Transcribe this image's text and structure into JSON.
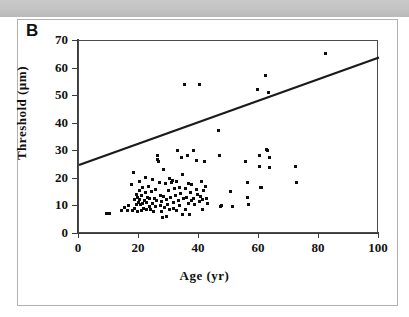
{
  "figure": {
    "panel_label": "B",
    "scan_band_text": "",
    "border_color": "#b0b0b0"
  },
  "chart_data": {
    "type": "scatter",
    "title": "",
    "xlabel": "Age (yr)",
    "ylabel": "Threshold (µm)",
    "xlim": [
      0,
      100
    ],
    "ylim": [
      0,
      70
    ],
    "xticks": [
      0,
      20,
      40,
      60,
      80,
      100
    ],
    "yticks": [
      0,
      10,
      20,
      30,
      40,
      50,
      60,
      70
    ],
    "grid": false,
    "legend": null,
    "annotation": "Thr = 0.39*Age + 25",
    "marker_color": "#0d0d0d",
    "line_color": "#1a1a1a",
    "fit": {
      "slope": 0.39,
      "intercept": 25,
      "x_start": 0,
      "x_end": 100,
      "y_start": 25,
      "y_end": 64
    },
    "points": [
      [
        9.0,
        7.6
      ],
      [
        10.2,
        7.6
      ],
      [
        14.3,
        8.4
      ],
      [
        15.3,
        9.6
      ],
      [
        16.2,
        8.4
      ],
      [
        16.5,
        10.2
      ],
      [
        17.6,
        18.0
      ],
      [
        17.9,
        8.4
      ],
      [
        18.2,
        22.2
      ],
      [
        18.4,
        12.4
      ],
      [
        18.6,
        9.2
      ],
      [
        19.0,
        14.4
      ],
      [
        19.2,
        10.6
      ],
      [
        19.4,
        8.3
      ],
      [
        19.6,
        13.2
      ],
      [
        19.8,
        11.4
      ],
      [
        20.0,
        19.2
      ],
      [
        20.1,
        15.6
      ],
      [
        20.3,
        12.6
      ],
      [
        20.5,
        10.8
      ],
      [
        20.7,
        8.6
      ],
      [
        20.9,
        13.8
      ],
      [
        21.1,
        11.2
      ],
      [
        21.3,
        16.8
      ],
      [
        21.5,
        9.4
      ],
      [
        21.8,
        12.0
      ],
      [
        22.0,
        20.4
      ],
      [
        22.2,
        15.0
      ],
      [
        22.4,
        11.6
      ],
      [
        22.6,
        8.8
      ],
      [
        22.9,
        13.4
      ],
      [
        23.1,
        17.4
      ],
      [
        23.4,
        10.0
      ],
      [
        23.6,
        12.8
      ],
      [
        23.9,
        9.0
      ],
      [
        24.1,
        15.4
      ],
      [
        24.4,
        19.8
      ],
      [
        24.6,
        11.0
      ],
      [
        24.9,
        8.2
      ],
      [
        25.1,
        13.0
      ],
      [
        25.4,
        16.2
      ],
      [
        25.6,
        9.8
      ],
      [
        25.9,
        12.2
      ],
      [
        26.1,
        28.6
      ],
      [
        26.3,
        27.0
      ],
      [
        26.6,
        26.4
      ],
      [
        26.8,
        18.6
      ],
      [
        27.0,
        10.4
      ],
      [
        27.2,
        14.0
      ],
      [
        27.4,
        8.0
      ],
      [
        27.6,
        11.8
      ],
      [
        27.9,
        6.0
      ],
      [
        28.1,
        23.4
      ],
      [
        28.3,
        13.6
      ],
      [
        28.5,
        9.6
      ],
      [
        28.7,
        18.2
      ],
      [
        29.0,
        12.4
      ],
      [
        29.2,
        6.2
      ],
      [
        29.5,
        10.6
      ],
      [
        29.8,
        15.8
      ],
      [
        30.0,
        20.0
      ],
      [
        30.3,
        8.8
      ],
      [
        30.6,
        13.2
      ],
      [
        30.9,
        18.8
      ],
      [
        31.1,
        19.4
      ],
      [
        31.4,
        11.4
      ],
      [
        31.6,
        9.2
      ],
      [
        31.9,
        16.4
      ],
      [
        32.1,
        13.8
      ],
      [
        32.4,
        19.0
      ],
      [
        32.6,
        8.6
      ],
      [
        32.9,
        30.4
      ],
      [
        33.1,
        12.0
      ],
      [
        33.4,
        17.0
      ],
      [
        33.6,
        10.2
      ],
      [
        33.9,
        14.6
      ],
      [
        34.1,
        27.6
      ],
      [
        34.4,
        21.6
      ],
      [
        34.6,
        7.2
      ],
      [
        34.9,
        12.8
      ],
      [
        35.1,
        54.2
      ],
      [
        35.4,
        16.6
      ],
      [
        35.6,
        9.0
      ],
      [
        35.9,
        13.4
      ],
      [
        36.1,
        28.4
      ],
      [
        36.4,
        11.0
      ],
      [
        36.6,
        18.4
      ],
      [
        36.9,
        7.0
      ],
      [
        37.1,
        15.2
      ],
      [
        37.4,
        12.2
      ],
      [
        37.6,
        17.8
      ],
      [
        38.0,
        30.4
      ],
      [
        38.3,
        13.0
      ],
      [
        38.6,
        10.8
      ],
      [
        39.0,
        26.8
      ],
      [
        39.3,
        16.0
      ],
      [
        39.6,
        14.2
      ],
      [
        40.0,
        54.2
      ],
      [
        40.2,
        11.8
      ],
      [
        40.5,
        13.6
      ],
      [
        40.8,
        19.2
      ],
      [
        41.0,
        12.6
      ],
      [
        41.3,
        8.8
      ],
      [
        41.6,
        15.6
      ],
      [
        41.9,
        26.2
      ],
      [
        42.1,
        17.2
      ],
      [
        42.4,
        13.0
      ],
      [
        42.8,
        11.2
      ],
      [
        46.4,
        37.4
      ],
      [
        46.8,
        28.4
      ],
      [
        47.0,
        10.0
      ],
      [
        47.4,
        10.2
      ],
      [
        50.6,
        15.4
      ],
      [
        51.0,
        10.0
      ],
      [
        55.6,
        26.4
      ],
      [
        56.0,
        18.8
      ],
      [
        56.3,
        13.2
      ],
      [
        56.6,
        10.8
      ],
      [
        59.6,
        52.4
      ],
      [
        60.0,
        28.4
      ],
      [
        60.3,
        24.6
      ],
      [
        60.6,
        16.8
      ],
      [
        60.9,
        17.0
      ],
      [
        62.3,
        57.4
      ],
      [
        62.6,
        30.8
      ],
      [
        62.8,
        30.4
      ],
      [
        63.0,
        51.2
      ],
      [
        63.4,
        27.6
      ],
      [
        63.6,
        24.0
      ],
      [
        72.0,
        24.6
      ],
      [
        72.4,
        18.8
      ],
      [
        82.0,
        65.5
      ]
    ]
  }
}
